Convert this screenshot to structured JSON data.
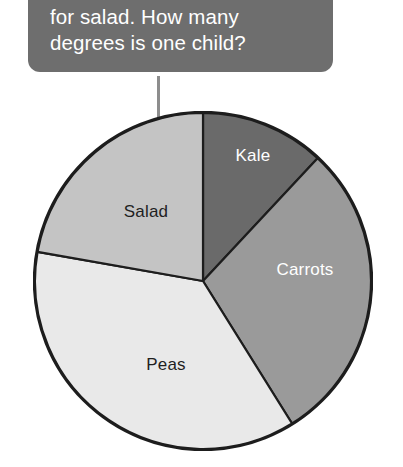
{
  "callout": {
    "line1": "for salad. How many",
    "line2": "degrees is one child?",
    "bg_color": "#6e6e6e",
    "text_color": "#ffffff"
  },
  "pointer": {
    "name": "arrow-pointing-to-salad-slice",
    "color": "#8d8d8d"
  },
  "chart_data": {
    "type": "pie",
    "title": "",
    "xlabel": "",
    "ylabel": "",
    "legend": "none",
    "grid": false,
    "start_angle_deg": 0,
    "direction": "clockwise",
    "categories": [
      "Kale",
      "Carrots",
      "Peas",
      "Salad"
    ],
    "values": [
      43,
      105,
      132,
      80
    ],
    "unit": "degrees",
    "slices": [
      {
        "label": "Kale",
        "degrees": 43,
        "start_deg": 0,
        "end_deg": 43,
        "color": "#6a6a6a",
        "label_color": "#ffffff",
        "label_x": 253,
        "label_y": 156
      },
      {
        "label": "Carrots",
        "degrees": 105,
        "start_deg": 43,
        "end_deg": 148,
        "color": "#9a9a9a",
        "label_color": "#ffffff",
        "label_x": 305,
        "label_y": 270
      },
      {
        "label": "Peas",
        "degrees": 132,
        "start_deg": 148,
        "end_deg": 280,
        "color": "#e9e9e9",
        "label_color": "#1f1f1f",
        "label_x": 166,
        "label_y": 365
      },
      {
        "label": "Salad",
        "degrees": 80,
        "start_deg": 280,
        "end_deg": 360,
        "color": "#c4c4c4",
        "label_color": "#1f1f1f",
        "label_x": 146,
        "label_y": 212
      }
    ],
    "outline_color": "#1d1d1d",
    "center_x": 203,
    "center_y": 281,
    "radius": 170
  }
}
